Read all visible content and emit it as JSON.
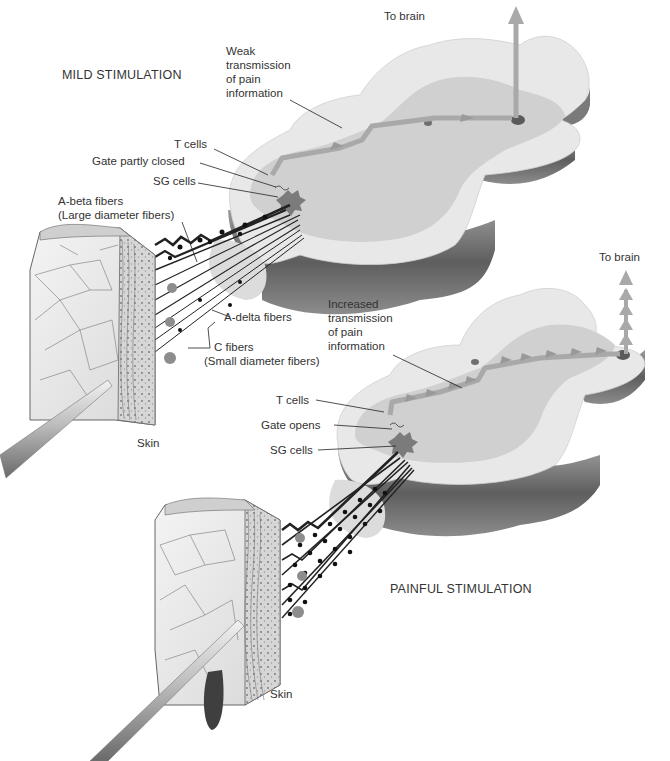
{
  "figure": {
    "topic": "Gate control theory of pain",
    "colors": {
      "cord_white_matter": "#e6e6e6",
      "cord_gray_matter": "#cfcfcf",
      "cord_side_dark": "#6d6d6d",
      "pathway_arrow": "#a9a9a9",
      "sg_cell": "#7b7b7b",
      "fiber": "#222222",
      "skin_light": "#ededed",
      "needle": "#b5b5b5"
    }
  },
  "mild": {
    "title": "MILD STIMULATION",
    "to_brain": "To brain",
    "transmission": [
      "Weak",
      "transmission",
      "of pain",
      "information"
    ],
    "t_cells": "T cells",
    "gate": "Gate partly closed",
    "sg_cells": "SG cells",
    "a_beta": [
      "A-beta fibers",
      "(Large diameter fibers)"
    ],
    "a_delta": "A-delta fibers",
    "c_fibers": [
      "C fibers",
      "(Small diameter fibers)"
    ],
    "skin": "Skin"
  },
  "painful": {
    "title": "PAINFUL STIMULATION",
    "to_brain": "To brain",
    "transmission": [
      "Increased",
      "transmission",
      "of pain",
      "information"
    ],
    "t_cells": "T cells",
    "gate": "Gate opens",
    "sg_cells": "SG cells",
    "skin": "Skin"
  }
}
